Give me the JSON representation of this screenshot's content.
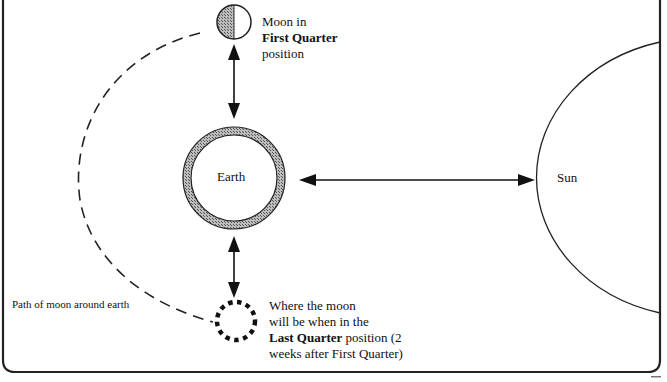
{
  "diagram": {
    "labels": {
      "moon_first_quarter": {
        "line1": "Moon in",
        "line2": "First Quarter",
        "line3": "position"
      },
      "earth": "Earth",
      "sun": "Sun",
      "path": "Path of moon around earth",
      "moon_last_quarter": {
        "line1": "Where the moon",
        "line2": "will be when in the",
        "line3_bold": "Last Quarter",
        "line3_rest": " position (2",
        "line4": "weeks after First Quarter)"
      }
    },
    "colors": {
      "stroke": "#111111",
      "shade": "#888888",
      "background": "#ffffff"
    }
  }
}
